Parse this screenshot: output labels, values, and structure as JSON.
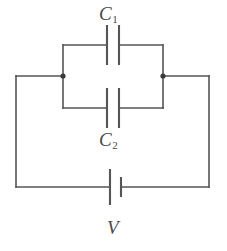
{
  "diagram": {
    "kind": "electrical-circuit-schematic",
    "background_color": "#ffffff",
    "line_color": "#555555",
    "label_color": "#4a4a4a",
    "node_color": "#3a3a3a",
    "labels": {
      "capacitor_top": {
        "symbol": "C",
        "subscript": "1"
      },
      "capacitor_bottom": {
        "symbol": "C",
        "subscript": "2"
      },
      "source": {
        "symbol": "V",
        "subscript": ""
      }
    },
    "components": [
      {
        "name": "capacitor-c1",
        "type": "capacitor",
        "label": "C1",
        "branch": "top-parallel-branch"
      },
      {
        "name": "capacitor-c2",
        "type": "capacitor",
        "label": "C2",
        "branch": "bottom-parallel-branch"
      },
      {
        "name": "voltage-source-v",
        "type": "battery",
        "label": "V",
        "branch": "bottom-outer-wire"
      }
    ],
    "nodes": [
      {
        "name": "left-junction",
        "x": 63,
        "y": 76
      },
      {
        "name": "right-junction",
        "x": 163,
        "y": 76
      }
    ],
    "geometry": {
      "outer_loop": {
        "left": 16,
        "right": 209,
        "top": 76,
        "bottom": 187
      },
      "inner_loop": {
        "left": 63,
        "right": 163,
        "top": 45,
        "bottom": 108
      },
      "capacitor_plates": {
        "left_x": 107,
        "right_x": 119,
        "half_height": 20
      },
      "battery_plates": {
        "long_x": 110,
        "short_x": 121,
        "long_half_height": 18,
        "short_half_height": 10
      }
    }
  }
}
